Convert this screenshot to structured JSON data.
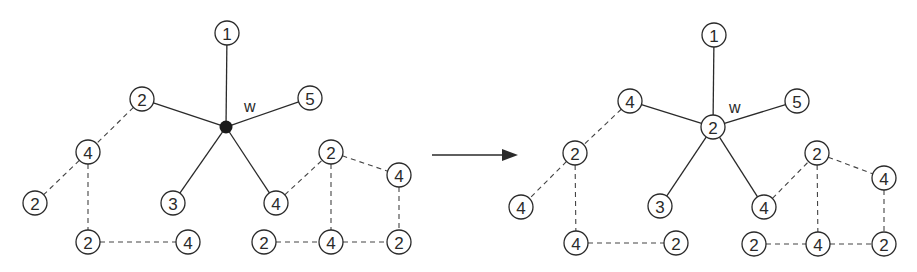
{
  "diagram": {
    "node_radius": 12,
    "colors": {
      "stroke": "#2a2a2a",
      "hub": "#1a1a1a",
      "background": "#ffffff"
    },
    "arrow": {
      "x1": 432,
      "y1": 155,
      "x2": 518,
      "y2": 155
    },
    "panels": [
      {
        "id": "before",
        "hub": {
          "x": 226,
          "y": 127,
          "label": "",
          "filled": true,
          "name_label": "w",
          "name_x": 244,
          "name_y": 112
        },
        "nodes": [
          {
            "id": "a1",
            "x": 227,
            "y": 33,
            "label": "1"
          },
          {
            "id": "a2",
            "x": 142,
            "y": 99,
            "label": "2"
          },
          {
            "id": "a3",
            "x": 310,
            "y": 98,
            "label": "5"
          },
          {
            "id": "a4",
            "x": 173,
            "y": 203,
            "label": "3"
          },
          {
            "id": "a5",
            "x": 276,
            "y": 203,
            "label": "4"
          },
          {
            "id": "b1",
            "x": 88,
            "y": 152,
            "label": "4"
          },
          {
            "id": "b2",
            "x": 35,
            "y": 203,
            "label": "2"
          },
          {
            "id": "b3",
            "x": 88,
            "y": 242,
            "label": "2"
          },
          {
            "id": "b4",
            "x": 188,
            "y": 242,
            "label": "4"
          },
          {
            "id": "c1",
            "x": 331,
            "y": 152,
            "label": "2"
          },
          {
            "id": "c2",
            "x": 399,
            "y": 175,
            "label": "4"
          },
          {
            "id": "c3",
            "x": 264,
            "y": 242,
            "label": "2"
          },
          {
            "id": "c4",
            "x": 331,
            "y": 242,
            "label": "4"
          },
          {
            "id": "c5",
            "x": 399,
            "y": 242,
            "label": "2"
          }
        ],
        "solid_edges": [
          [
            "hub",
            "a1"
          ],
          [
            "hub",
            "a2"
          ],
          [
            "hub",
            "a3"
          ],
          [
            "hub",
            "a4"
          ],
          [
            "hub",
            "a5"
          ]
        ],
        "dashed_edges": [
          [
            "a2",
            "b1"
          ],
          [
            "b1",
            "b2"
          ],
          [
            "b1",
            "b3"
          ],
          [
            "b3",
            "b4"
          ],
          [
            "a5",
            "c1"
          ],
          [
            "c1",
            "c2"
          ],
          [
            "c1",
            "c4"
          ],
          [
            "c2",
            "c5"
          ],
          [
            "c3",
            "c4"
          ],
          [
            "c4",
            "c5"
          ]
        ]
      },
      {
        "id": "after",
        "hub": {
          "x": 713,
          "y": 127,
          "label": "2",
          "filled": false,
          "name_label": "w",
          "name_x": 729,
          "name_y": 113
        },
        "nodes": [
          {
            "id": "a1",
            "x": 714,
            "y": 35,
            "label": "1"
          },
          {
            "id": "a2",
            "x": 630,
            "y": 101,
            "label": "4"
          },
          {
            "id": "a3",
            "x": 797,
            "y": 101,
            "label": "5"
          },
          {
            "id": "a4",
            "x": 660,
            "y": 206,
            "label": "3"
          },
          {
            "id": "a5",
            "x": 764,
            "y": 207,
            "label": "4"
          },
          {
            "id": "b1",
            "x": 575,
            "y": 153,
            "label": "2"
          },
          {
            "id": "b2",
            "x": 521,
            "y": 207,
            "label": "4"
          },
          {
            "id": "b3",
            "x": 576,
            "y": 243,
            "label": "4"
          },
          {
            "id": "b4",
            "x": 676,
            "y": 243,
            "label": "2"
          },
          {
            "id": "c1",
            "x": 817,
            "y": 153,
            "label": "2"
          },
          {
            "id": "c2",
            "x": 884,
            "y": 178,
            "label": "4"
          },
          {
            "id": "c3",
            "x": 754,
            "y": 244,
            "label": "2"
          },
          {
            "id": "c4",
            "x": 818,
            "y": 244,
            "label": "4"
          },
          {
            "id": "c5",
            "x": 884,
            "y": 244,
            "label": "2"
          }
        ],
        "solid_edges": [
          [
            "hub",
            "a1"
          ],
          [
            "hub",
            "a2"
          ],
          [
            "hub",
            "a3"
          ],
          [
            "hub",
            "a4"
          ],
          [
            "hub",
            "a5"
          ]
        ],
        "dashed_edges": [
          [
            "a2",
            "b1"
          ],
          [
            "b1",
            "b2"
          ],
          [
            "b1",
            "b3"
          ],
          [
            "b3",
            "b4"
          ],
          [
            "a5",
            "c1"
          ],
          [
            "c1",
            "c2"
          ],
          [
            "c1",
            "c4"
          ],
          [
            "c2",
            "c5"
          ],
          [
            "c3",
            "c4"
          ],
          [
            "c4",
            "c5"
          ]
        ]
      }
    ]
  }
}
